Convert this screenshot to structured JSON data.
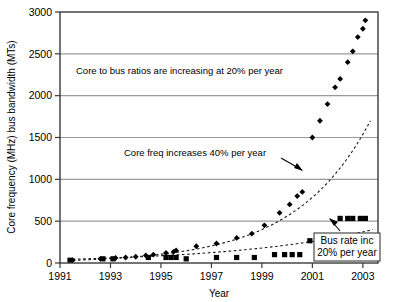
{
  "chart_data": {
    "type": "scatter",
    "title": "",
    "xlabel": "Year",
    "ylabel": "Core frequency (MHz) bus bandwidth (MTs)",
    "xlim": [
      1991,
      2003.6
    ],
    "ylim": [
      0,
      3000
    ],
    "xticks": [
      "1991",
      "1993",
      "1995",
      "1997",
      "1999",
      "2001",
      "2003"
    ],
    "xtick_values": [
      1991,
      1993,
      1995,
      1997,
      1999,
      2001,
      2003
    ],
    "yticks": [
      "0",
      "500",
      "1000",
      "1500",
      "2000",
      "2500",
      "3000"
    ],
    "ytick_values": [
      0,
      500,
      1000,
      1500,
      2000,
      2500,
      3000
    ],
    "grid": "horizontal",
    "legend_position": "none",
    "series": [
      {
        "name": "Core frequency",
        "marker": "diamond",
        "color": "#000000",
        "points": [
          {
            "x": 1991.5,
            "y": 33
          },
          {
            "x": 1992.6,
            "y": 50
          },
          {
            "x": 1993.2,
            "y": 60
          },
          {
            "x": 1993.6,
            "y": 66
          },
          {
            "x": 1994.0,
            "y": 75
          },
          {
            "x": 1994.4,
            "y": 90
          },
          {
            "x": 1994.7,
            "y": 100
          },
          {
            "x": 1995.2,
            "y": 120
          },
          {
            "x": 1995.5,
            "y": 133
          },
          {
            "x": 1995.6,
            "y": 150
          },
          {
            "x": 1996.4,
            "y": 200
          },
          {
            "x": 1997.2,
            "y": 233
          },
          {
            "x": 1998.0,
            "y": 300
          },
          {
            "x": 1998.6,
            "y": 350
          },
          {
            "x": 1999.1,
            "y": 450
          },
          {
            "x": 1999.7,
            "y": 600
          },
          {
            "x": 2000.1,
            "y": 700
          },
          {
            "x": 2000.4,
            "y": 800
          },
          {
            "x": 2000.6,
            "y": 850
          },
          {
            "x": 2001.0,
            "y": 1500
          },
          {
            "x": 2001.3,
            "y": 1700
          },
          {
            "x": 2001.6,
            "y": 1900
          },
          {
            "x": 2001.9,
            "y": 2100
          },
          {
            "x": 2002.1,
            "y": 2200
          },
          {
            "x": 2002.4,
            "y": 2400
          },
          {
            "x": 2002.6,
            "y": 2530
          },
          {
            "x": 2002.8,
            "y": 2700
          },
          {
            "x": 2003.0,
            "y": 2800
          },
          {
            "x": 2003.1,
            "y": 2900
          }
        ]
      },
      {
        "name": "Bus rate",
        "marker": "square",
        "color": "#000000",
        "points": [
          {
            "x": 1991.4,
            "y": 33
          },
          {
            "x": 1992.7,
            "y": 50
          },
          {
            "x": 1993.1,
            "y": 50
          },
          {
            "x": 1994.5,
            "y": 66
          },
          {
            "x": 1995.2,
            "y": 66
          },
          {
            "x": 1995.4,
            "y": 66
          },
          {
            "x": 1995.6,
            "y": 66
          },
          {
            "x": 1996.0,
            "y": 50
          },
          {
            "x": 1997.2,
            "y": 66
          },
          {
            "x": 1998.0,
            "y": 66
          },
          {
            "x": 1998.7,
            "y": 66
          },
          {
            "x": 1999.5,
            "y": 100
          },
          {
            "x": 1999.9,
            "y": 100
          },
          {
            "x": 2000.2,
            "y": 100
          },
          {
            "x": 2000.5,
            "y": 100
          },
          {
            "x": 2000.9,
            "y": 266
          },
          {
            "x": 2001.5,
            "y": 266
          },
          {
            "x": 2001.8,
            "y": 266
          },
          {
            "x": 2002.1,
            "y": 533
          },
          {
            "x": 2002.4,
            "y": 533
          },
          {
            "x": 2002.6,
            "y": 533
          },
          {
            "x": 2002.9,
            "y": 533
          },
          {
            "x": 2003.1,
            "y": 533
          }
        ]
      }
    ],
    "trendlines": [
      {
        "name": "Core freq trend",
        "style": "dashed",
        "growth_pct_per_year": 40
      },
      {
        "name": "Bus rate trend",
        "style": "dashed",
        "growth_pct_per_year": 20
      }
    ],
    "annotations": [
      {
        "id": "core-bus-ratio",
        "text": "Core to bus ratios are increasing at 20% per year",
        "arrow": false
      },
      {
        "id": "core-freq-growth",
        "text": "Core freq increases 40% per year",
        "arrow": true
      },
      {
        "id": "bus-rate-growth",
        "text_line1": "Bus rate inc",
        "text_line2": "20% per year",
        "arrow": true,
        "boxed": true
      }
    ]
  },
  "axes": {
    "y_title": "Core frequency (MHz) bus bandwidth (MTs)",
    "x_title": "Year"
  },
  "colors": {
    "marker": "#000000",
    "grid": "#9a9a9a",
    "frame": "#3a3a3a",
    "background": "#ffffff"
  }
}
